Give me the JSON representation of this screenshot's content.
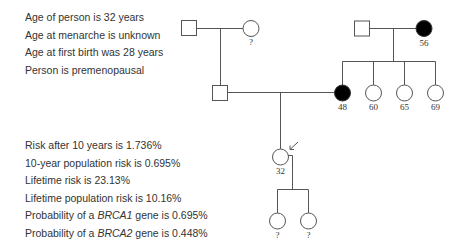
{
  "person_info": [
    "Age of person is 32 years",
    "Age at menarche is unknown",
    "Age at first birth was 28 years",
    "Person is premenopausal"
  ],
  "risk_results": [
    {
      "text": "Risk after 10 years is 1.736%"
    },
    {
      "text": "10-year population risk is 0.695%"
    },
    {
      "text": "Lifetime risk is 23.13%"
    },
    {
      "text": "Lifetime population risk is 10.16%"
    },
    {
      "prefix": "Probability of a ",
      "gene": "BRCA1",
      "suffix": " gene is 0.695%"
    },
    {
      "prefix": "Probability of a ",
      "gene": "BRCA2",
      "suffix": " gene is 0.448%"
    }
  ],
  "pedigree": {
    "paternal_grandfather": {
      "sex": "male",
      "affected": false,
      "label": ""
    },
    "paternal_grandmother": {
      "sex": "female",
      "affected": false,
      "label": "?"
    },
    "father": {
      "sex": "male",
      "affected": false,
      "label": ""
    },
    "maternal_grandfather": {
      "sex": "male",
      "affected": false,
      "label": ""
    },
    "maternal_grandmother": {
      "sex": "female",
      "affected": true,
      "label": "56"
    },
    "mother": {
      "sex": "female",
      "affected": true,
      "label": "48"
    },
    "maternal_aunts": [
      {
        "sex": "female",
        "affected": false,
        "label": "60"
      },
      {
        "sex": "female",
        "affected": false,
        "label": "65"
      },
      {
        "sex": "female",
        "affected": false,
        "label": "69"
      }
    ],
    "proband": {
      "sex": "female",
      "affected": false,
      "label": "32",
      "indicator": "arrow"
    },
    "daughters": [
      {
        "sex": "female",
        "affected": false,
        "label": "?"
      },
      {
        "sex": "female",
        "affected": false,
        "label": "?"
      }
    ],
    "colors": {
      "line": "#555555",
      "affected_fill": "#000000",
      "unaffected_fill": "#ffffff"
    }
  }
}
